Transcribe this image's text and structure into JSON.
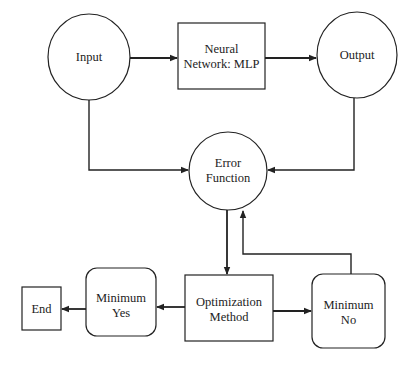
{
  "diagram": {
    "type": "flowchart",
    "nodes": {
      "input": {
        "label": "Input",
        "shape": "ellipse"
      },
      "mlp": {
        "line1": "Neural",
        "line2": "Network: MLP",
        "shape": "rectangle"
      },
      "output": {
        "label": "Output",
        "shape": "ellipse"
      },
      "error": {
        "line1": "Error",
        "line2": "Function",
        "shape": "circle"
      },
      "optimization": {
        "line1": "Optimization",
        "line2": "Method",
        "shape": "rectangle"
      },
      "min_yes": {
        "line1": "Minimum",
        "line2": "Yes",
        "shape": "rounded-rectangle"
      },
      "min_no": {
        "line1": "Minimum",
        "line2": "No",
        "shape": "rounded-rectangle"
      },
      "end": {
        "label": "End",
        "shape": "rectangle"
      }
    },
    "edges": [
      {
        "from": "Input",
        "to": "Neural Network: MLP"
      },
      {
        "from": "Neural Network: MLP",
        "to": "Output"
      },
      {
        "from": "Input",
        "to": "Error Function"
      },
      {
        "from": "Output",
        "to": "Error Function"
      },
      {
        "from": "Error Function",
        "to": "Optimization Method"
      },
      {
        "from": "Optimization Method",
        "to": "Minimum Yes"
      },
      {
        "from": "Optimization Method",
        "to": "Minimum No"
      },
      {
        "from": "Minimum Yes",
        "to": "End"
      },
      {
        "from": "Minimum No",
        "to": "Error Function"
      }
    ]
  }
}
